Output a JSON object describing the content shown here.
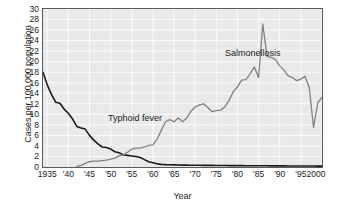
{
  "chart_data": {
    "type": "line",
    "title": "",
    "xlabel": "Year",
    "ylabel": "Cases per 100,000 population",
    "xlim": [
      1934,
      2000
    ],
    "ylim": [
      0,
      30
    ],
    "grid": true,
    "legend_position": "inline-annotation",
    "y_ticks": [
      0,
      2,
      4,
      6,
      8,
      10,
      12,
      14,
      16,
      18,
      20,
      22,
      24,
      26,
      28,
      30
    ],
    "y_tick_labels": [
      "0",
      "2",
      "4",
      "6",
      "8",
      "10",
      "12",
      "14",
      "16",
      "18",
      "20",
      "22",
      "24",
      "26",
      "28",
      "30"
    ],
    "x_ticks": [
      1935,
      1940,
      1945,
      1950,
      1955,
      1960,
      1965,
      1970,
      1975,
      1980,
      1985,
      1990,
      1995,
      2000
    ],
    "x_tick_labels": [
      "1935",
      "'40",
      "'45",
      "'50",
      "'55",
      "'60",
      "'65",
      "'70",
      "'75",
      "'80",
      "'85",
      "'90",
      "'95",
      "2000"
    ],
    "annotations": [
      {
        "text": "Typhoid fever",
        "x": 1943,
        "y": 11.5
      },
      {
        "text": "Salmonellosis",
        "x": 1977,
        "y": 24.5
      }
    ],
    "series": [
      {
        "name": "Typhoid fever",
        "color": "#1a1a1a",
        "x": [
          1934,
          1935,
          1936,
          1937,
          1938,
          1939,
          1940,
          1941,
          1942,
          1943,
          1944,
          1945,
          1946,
          1947,
          1948,
          1949,
          1950,
          1951,
          1952,
          1953,
          1954,
          1955,
          1956,
          1957,
          1958,
          1959,
          1960,
          1961,
          1962,
          1963,
          1964,
          1965,
          1966,
          1967,
          1968,
          1969,
          1970,
          1971,
          1972,
          1973,
          1974,
          1975,
          1976,
          1977,
          1978,
          1979,
          1980,
          1981,
          1982,
          1983,
          1984,
          1985,
          1986,
          1987,
          1988,
          1989,
          1990,
          1991,
          1992,
          1993,
          1994,
          1995,
          1996,
          1997,
          1998,
          1999,
          2000
        ],
        "y": [
          18.0,
          15.6,
          13.8,
          12.3,
          12.1,
          11.0,
          10.2,
          9.1,
          7.7,
          7.4,
          7.2,
          6.0,
          5.1,
          4.4,
          3.8,
          3.7,
          3.4,
          2.9,
          2.7,
          2.3,
          2.2,
          2.1,
          2.0,
          1.8,
          1.4,
          1.0,
          0.8,
          0.6,
          0.5,
          0.45,
          0.42,
          0.4,
          0.38,
          0.36,
          0.35,
          0.34,
          0.33,
          0.32,
          0.31,
          0.3,
          0.3,
          0.29,
          0.28,
          0.28,
          0.27,
          0.27,
          0.26,
          0.26,
          0.25,
          0.25,
          0.24,
          0.24,
          0.23,
          0.23,
          0.22,
          0.22,
          0.21,
          0.21,
          0.2,
          0.2,
          0.2,
          0.19,
          0.19,
          0.18,
          0.18,
          0.17,
          0.17
        ]
      },
      {
        "name": "Salmonellosis",
        "color": "#808080",
        "x": [
          1942,
          1943,
          1944,
          1945,
          1946,
          1947,
          1948,
          1949,
          1950,
          1951,
          1952,
          1953,
          1954,
          1955,
          1956,
          1957,
          1958,
          1959,
          1960,
          1961,
          1962,
          1963,
          1964,
          1965,
          1966,
          1967,
          1968,
          1969,
          1970,
          1971,
          1972,
          1973,
          1974,
          1975,
          1976,
          1977,
          1978,
          1979,
          1980,
          1981,
          1982,
          1983,
          1984,
          1985,
          1986,
          1987,
          1988,
          1989,
          1990,
          1991,
          1992,
          1993,
          1994,
          1995,
          1996,
          1997,
          1998,
          1999,
          2000
        ],
        "y": [
          0.1,
          0.3,
          0.7,
          1.0,
          1.1,
          1.1,
          1.2,
          1.3,
          1.5,
          1.7,
          2.1,
          2.3,
          2.8,
          3.4,
          3.6,
          3.6,
          3.8,
          4.1,
          4.2,
          5.3,
          7.0,
          8.6,
          9.0,
          8.6,
          9.3,
          8.6,
          9.3,
          10.6,
          11.4,
          11.8,
          12.0,
          11.3,
          10.5,
          10.7,
          10.8,
          11.4,
          12.6,
          14.3,
          15.2,
          16.5,
          16.6,
          17.7,
          19.0,
          17.0,
          27.1,
          21.0,
          20.8,
          20.4,
          19.2,
          18.4,
          17.3,
          17.0,
          16.4,
          16.7,
          17.2,
          15.0,
          7.5,
          12.2,
          13.2
        ]
      }
    ]
  }
}
